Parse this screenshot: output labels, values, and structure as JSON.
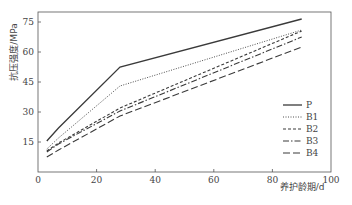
{
  "chart_data": {
    "type": "line",
    "title": "",
    "xlabel": "养护龄期/d",
    "ylabel": "抗压强度/MPa",
    "xlim": [
      0,
      100
    ],
    "ylim": [
      0,
      80
    ],
    "xticks": [
      0,
      20,
      40,
      60,
      80,
      100
    ],
    "yticks": [
      15,
      30,
      45,
      60,
      75
    ],
    "grid": false,
    "legend_position": "lower right",
    "x": [
      3,
      7,
      28,
      90
    ],
    "series": [
      {
        "name": "P",
        "style": "solid",
        "values": [
          15.5,
          22,
          52.5,
          76.5
        ]
      },
      {
        "name": "B1",
        "style": "dotted",
        "values": [
          11.5,
          17,
          43,
          71
        ]
      },
      {
        "name": "B2",
        "style": "dashed",
        "values": [
          10.5,
          14.5,
          32,
          70.5
        ]
      },
      {
        "name": "B3",
        "style": "dashdot",
        "values": [
          10,
          14,
          30.5,
          67.5
        ]
      },
      {
        "name": "B4",
        "style": "longdash",
        "values": [
          7.5,
          11,
          28,
          62.5
        ]
      }
    ]
  },
  "colors": {
    "line": "#3a3a3a",
    "axis": "#555555"
  }
}
